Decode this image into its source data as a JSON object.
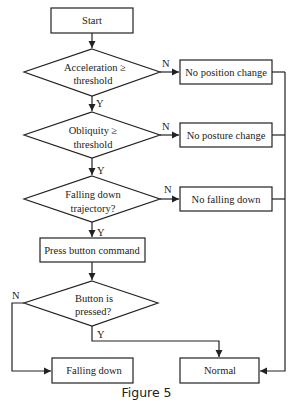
{
  "figure": {
    "caption": "Figure 5",
    "nodes": {
      "start": {
        "label": "Start"
      },
      "acceleration": {
        "line1": "Acceleration ≥",
        "line2": "threshold"
      },
      "no_position_change": {
        "label": "No position change"
      },
      "obliquity": {
        "line1": "Obliquity ≥",
        "line2": "threshold"
      },
      "no_posture_change": {
        "label": "No posture change"
      },
      "trajectory": {
        "line1": "Falling down",
        "line2": "trajectory?"
      },
      "no_falling_down": {
        "label": "No falling down"
      },
      "press_button_command": {
        "label": "Press button command"
      },
      "button_pressed": {
        "line1": "Button is",
        "line2": "pressed?"
      },
      "falling_down": {
        "label": "Falling down"
      },
      "normal": {
        "label": "Normal"
      }
    },
    "edge_labels": {
      "acc_no": "N",
      "acc_yes": "Y",
      "obl_no": "N",
      "obl_yes": "Y",
      "traj_no": "N",
      "traj_yes": "Y",
      "button_no": "N",
      "button_yes": "Y"
    },
    "colors": {
      "line": "#222222",
      "background": "#ffffff"
    }
  }
}
